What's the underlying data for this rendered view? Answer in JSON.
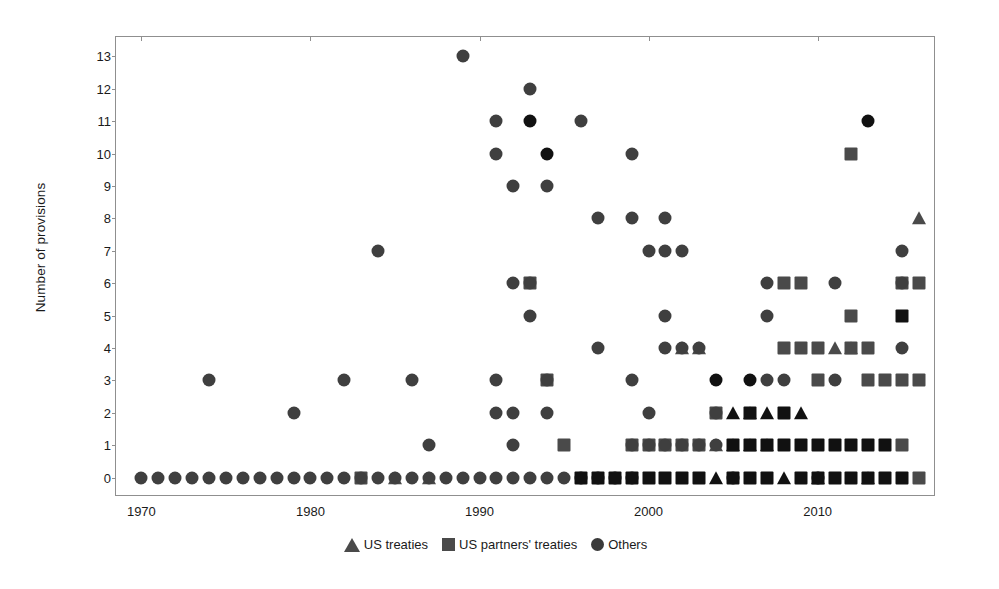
{
  "chart_data": {
    "type": "scatter",
    "title": "",
    "xlabel": "",
    "ylabel": "Number of provisions",
    "xlim": [
      1968.5,
      2017.0
    ],
    "ylim": [
      -0.6,
      13.6
    ],
    "grid": false,
    "xticks": [
      1970,
      1980,
      1990,
      2000,
      2010
    ],
    "yticks": [
      0,
      1,
      2,
      3,
      4,
      5,
      6,
      7,
      8,
      9,
      10,
      11,
      12,
      13
    ],
    "legend_position": "bottom-center",
    "marker_colors": {
      "us_treaties": "#4a4a4a",
      "us_partners_treaties": "#4a4a4a",
      "others": "#3f3f3f",
      "dark": "#111111"
    },
    "series": [
      {
        "name": "US treaties",
        "marker": "triangle",
        "points": [
          [
            1985,
            0
          ],
          [
            1987,
            0
          ],
          [
            2002,
            4
          ],
          [
            2003,
            4
          ],
          [
            2004,
            1
          ],
          [
            2005,
            2
          ],
          [
            2006,
            2
          ],
          [
            2007,
            2
          ],
          [
            2005,
            1
          ],
          [
            2006,
            1
          ],
          [
            2007,
            1
          ],
          [
            2009,
            2
          ],
          [
            2011,
            4
          ],
          [
            2012,
            4
          ],
          [
            2004,
            0
          ],
          [
            2008,
            0
          ],
          [
            2010,
            0
          ],
          [
            2013,
            0
          ],
          [
            2016,
            8
          ]
        ]
      },
      {
        "name": "US partners' treaties",
        "marker": "square",
        "points": [
          [
            1983,
            0
          ],
          [
            1993,
            6
          ],
          [
            1994,
            3
          ],
          [
            1995,
            1
          ],
          [
            1996,
            0
          ],
          [
            1997,
            0
          ],
          [
            1998,
            0
          ],
          [
            1999,
            0
          ],
          [
            1999,
            1
          ],
          [
            2000,
            0
          ],
          [
            2000,
            1
          ],
          [
            2001,
            0
          ],
          [
            2001,
            1
          ],
          [
            2002,
            0
          ],
          [
            2002,
            1
          ],
          [
            2003,
            0
          ],
          [
            2003,
            1
          ],
          [
            2004,
            2
          ],
          [
            2005,
            1
          ],
          [
            2005,
            0
          ],
          [
            2006,
            1
          ],
          [
            2006,
            0
          ],
          [
            2006,
            2
          ],
          [
            2007,
            1
          ],
          [
            2007,
            0
          ],
          [
            2008,
            4
          ],
          [
            2008,
            6
          ],
          [
            2008,
            2
          ],
          [
            2008,
            1
          ],
          [
            2009,
            4
          ],
          [
            2009,
            6
          ],
          [
            2009,
            1
          ],
          [
            2009,
            0
          ],
          [
            2010,
            4
          ],
          [
            2010,
            3
          ],
          [
            2010,
            1
          ],
          [
            2010,
            0
          ],
          [
            2011,
            1
          ],
          [
            2011,
            0
          ],
          [
            2012,
            10
          ],
          [
            2012,
            5
          ],
          [
            2012,
            4
          ],
          [
            2012,
            1
          ],
          [
            2012,
            0
          ],
          [
            2013,
            4
          ],
          [
            2013,
            1
          ],
          [
            2013,
            3
          ],
          [
            2013,
            0
          ],
          [
            2014,
            1
          ],
          [
            2014,
            0
          ],
          [
            2014,
            3
          ],
          [
            2015,
            6
          ],
          [
            2015,
            5
          ],
          [
            2015,
            3
          ],
          [
            2015,
            1
          ],
          [
            2015,
            0
          ],
          [
            2016,
            6
          ],
          [
            2016,
            3
          ],
          [
            2016,
            0
          ]
        ]
      },
      {
        "name": "Others",
        "marker": "circle",
        "points": [
          [
            1970,
            0
          ],
          [
            1971,
            0
          ],
          [
            1972,
            0
          ],
          [
            1973,
            0
          ],
          [
            1974,
            0
          ],
          [
            1974,
            3
          ],
          [
            1975,
            0
          ],
          [
            1976,
            0
          ],
          [
            1977,
            0
          ],
          [
            1978,
            0
          ],
          [
            1979,
            0
          ],
          [
            1979,
            2
          ],
          [
            1980,
            0
          ],
          [
            1981,
            0
          ],
          [
            1982,
            0
          ],
          [
            1982,
            3
          ],
          [
            1983,
            0
          ],
          [
            1984,
            0
          ],
          [
            1984,
            7
          ],
          [
            1985,
            0
          ],
          [
            1986,
            0
          ],
          [
            1986,
            3
          ],
          [
            1987,
            0
          ],
          [
            1987,
            1
          ],
          [
            1988,
            0
          ],
          [
            1989,
            0
          ],
          [
            1989,
            13
          ],
          [
            1990,
            0
          ],
          [
            1991,
            0
          ],
          [
            1991,
            11
          ],
          [
            1991,
            10
          ],
          [
            1991,
            3
          ],
          [
            1991,
            2
          ],
          [
            1992,
            0
          ],
          [
            1992,
            1
          ],
          [
            1992,
            2
          ],
          [
            1992,
            6
          ],
          [
            1992,
            9
          ],
          [
            1993,
            0
          ],
          [
            1993,
            11
          ],
          [
            1993,
            12
          ],
          [
            1993,
            6
          ],
          [
            1993,
            5
          ],
          [
            1994,
            0
          ],
          [
            1994,
            9
          ],
          [
            1994,
            10
          ],
          [
            1994,
            3
          ],
          [
            1994,
            2
          ],
          [
            1995,
            0
          ],
          [
            1996,
            0
          ],
          [
            1996,
            11
          ],
          [
            1997,
            0
          ],
          [
            1997,
            8
          ],
          [
            1997,
            4
          ],
          [
            1998,
            0
          ],
          [
            1999,
            0
          ],
          [
            1999,
            8
          ],
          [
            1999,
            10
          ],
          [
            1999,
            3
          ],
          [
            1999,
            1
          ],
          [
            2000,
            7
          ],
          [
            2000,
            2
          ],
          [
            2000,
            1
          ],
          [
            2001,
            8
          ],
          [
            2001,
            7
          ],
          [
            2001,
            5
          ],
          [
            2001,
            4
          ],
          [
            2001,
            1
          ],
          [
            2002,
            7
          ],
          [
            2002,
            4
          ],
          [
            2002,
            1
          ],
          [
            2003,
            4
          ],
          [
            2003,
            1
          ],
          [
            2004,
            3
          ],
          [
            2004,
            2
          ],
          [
            2004,
            1
          ],
          [
            2005,
            0
          ],
          [
            2006,
            3
          ],
          [
            2007,
            6
          ],
          [
            2007,
            5
          ],
          [
            2007,
            3
          ],
          [
            2008,
            3
          ],
          [
            2010,
            0
          ],
          [
            2011,
            6
          ],
          [
            2011,
            3
          ],
          [
            2013,
            11
          ],
          [
            2015,
            7
          ],
          [
            2015,
            6
          ],
          [
            2015,
            4
          ]
        ]
      }
    ],
    "legend": [
      {
        "label": "US treaties",
        "marker": "triangle"
      },
      {
        "label": "US partners' treaties",
        "marker": "square"
      },
      {
        "label": "Others",
        "marker": "circle"
      }
    ]
  }
}
